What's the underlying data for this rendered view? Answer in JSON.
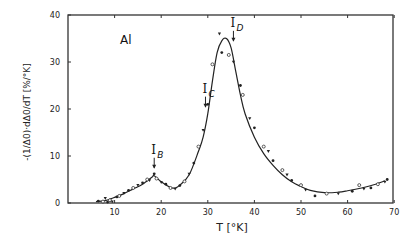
{
  "chart_data": {
    "type": "line",
    "title": "",
    "material_label": "Al",
    "xlabel": "T [°K]",
    "ylabel": "-(1/Δ0)·dΔ0/dT [%/°K]",
    "xlim": [
      0,
      70
    ],
    "ylim": [
      0,
      40
    ],
    "x_ticks": [
      10,
      20,
      30,
      40,
      50,
      60,
      70
    ],
    "y_ticks": [
      0,
      10,
      20,
      30,
      40
    ],
    "y_tick_labels": [
      "0",
      "10",
      "20",
      "30",
      "40"
    ],
    "x_tick_labels": [
      "10",
      "20",
      "30",
      "40",
      "50",
      "60",
      "70"
    ],
    "grid": false,
    "series": [
      {
        "name": "fit curve",
        "x": [
          6,
          8,
          10,
          12,
          14,
          16,
          18,
          18.5,
          20,
          22,
          23,
          24,
          26,
          28,
          29,
          30,
          31,
          32,
          33,
          34,
          35,
          36,
          37,
          38,
          40,
          42,
          44,
          46,
          48,
          50,
          52,
          55,
          58,
          60,
          63,
          66,
          68
        ],
        "values": [
          0.3,
          0.5,
          1.2,
          2.0,
          3.0,
          4.0,
          5.5,
          5.8,
          4.5,
          3.3,
          3.2,
          3.8,
          6.0,
          11.0,
          14.0,
          19.0,
          26.0,
          32.0,
          34.5,
          35.0,
          33.0,
          28.0,
          23.0,
          19.0,
          14.0,
          10.5,
          8.0,
          6.0,
          4.5,
          3.5,
          2.7,
          2.2,
          2.3,
          2.6,
          3.2,
          4.0,
          4.7
        ]
      },
      {
        "name": "measured points",
        "x": [
          6.5,
          7.5,
          8,
          8.5,
          9,
          9.5,
          10.5,
          11,
          12,
          13,
          14,
          15,
          16,
          17,
          17.5,
          18.5,
          19,
          20,
          21,
          22,
          23,
          24,
          25,
          26,
          27,
          28,
          29,
          30,
          31,
          32.5,
          33,
          34.5,
          35.5,
          37,
          37.5,
          39,
          40,
          42,
          43,
          44,
          46,
          47,
          48,
          50,
          51,
          53,
          55.5,
          58,
          61,
          62.5,
          63.5,
          65,
          66.5,
          68,
          68.5
        ],
        "values": [
          0.4,
          0.3,
          1.0,
          0.2,
          0.6,
          0.3,
          1.3,
          1.5,
          2.1,
          2.7,
          3.2,
          3.8,
          4.3,
          5.0,
          4.8,
          6.2,
          5.2,
          4.4,
          4.0,
          3.2,
          3.0,
          3.7,
          4.6,
          6.2,
          8.5,
          12.0,
          15.5,
          21.0,
          29.5,
          36.0,
          32.0,
          31.5,
          30.0,
          25.0,
          23.0,
          18.0,
          16.0,
          12.0,
          11.0,
          9.0,
          7.0,
          6.0,
          4.8,
          3.8,
          2.8,
          1.5,
          2.0,
          2.0,
          2.5,
          3.8,
          3.0,
          3.2,
          4.0,
          4.5,
          5.0
        ]
      }
    ],
    "annotations": [
      {
        "label": "I",
        "sub": "B",
        "x": 18.5,
        "y": 7.5,
        "arrow": true
      },
      {
        "label": "I",
        "sub": "C",
        "x": 29.5,
        "y": 20.5,
        "arrow": true
      },
      {
        "label": "I",
        "sub": "D",
        "x": 35.5,
        "y": 34.5,
        "arrow": true
      }
    ]
  }
}
